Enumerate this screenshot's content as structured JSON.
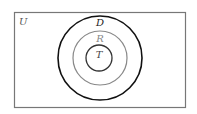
{
  "diagram": {
    "type": "venn",
    "universe": {
      "label": "U",
      "stroke": "#777777"
    },
    "sets": [
      {
        "label": "D",
        "stroke": "#111111",
        "label_color": "#222222"
      },
      {
        "label": "R",
        "stroke": "#888888",
        "label_color": "#888888"
      },
      {
        "label": "T",
        "stroke": "#333333",
        "label_color": "#444444"
      }
    ],
    "relationship": "T ⊂ R ⊂ D ⊂ U"
  }
}
